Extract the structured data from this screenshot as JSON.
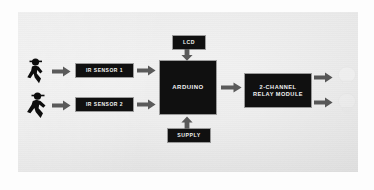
{
  "diagram": {
    "background_color": "#ececec",
    "node_color": "#101010",
    "node_text_color": "#f2f2f2",
    "nodes": {
      "ir_sensor_1": {
        "label": "IR SENSOR 1"
      },
      "ir_sensor_2": {
        "label": "IR SENSOR 2"
      },
      "arduino": {
        "label": "ARDUINO"
      },
      "lcd": {
        "label": "LCD"
      },
      "supply": {
        "label": "SUPPLY"
      },
      "relay": {
        "line1": "2-CHANNEL",
        "line2": "RELAY MODULE"
      }
    },
    "icons": {
      "person_1": "walking-person-icon",
      "person_2": "walking-person-icon",
      "bulb_1": "light-bulb-icon",
      "bulb_2": "light-bulb-icon"
    },
    "arrows": [
      {
        "name": "person1-to-ir-sensor-1",
        "direction": "right"
      },
      {
        "name": "person2-to-ir-sensor-2",
        "direction": "right"
      },
      {
        "name": "ir-sensor-1-to-arduino",
        "direction": "right"
      },
      {
        "name": "ir-sensor-2-to-arduino",
        "direction": "right"
      },
      {
        "name": "lcd-to-arduino",
        "direction": "down"
      },
      {
        "name": "supply-to-arduino",
        "direction": "up"
      },
      {
        "name": "arduino-to-relay",
        "direction": "right"
      },
      {
        "name": "relay-to-bulb-1",
        "direction": "right"
      },
      {
        "name": "relay-to-bulb-2",
        "direction": "right"
      }
    ]
  }
}
